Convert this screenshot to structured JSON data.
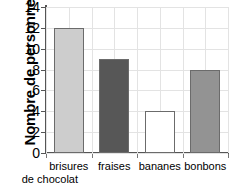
{
  "chart_data": {
    "type": "bar",
    "title": "",
    "xlabel": "",
    "ylabel": "Nombre de personnes",
    "categories": [
      "brisures de chocolat",
      "fraises",
      "bananes",
      "bonbons"
    ],
    "category_lines": [
      [
        "brisures",
        "de chocolat"
      ],
      [
        "fraises"
      ],
      [
        "bananes"
      ],
      [
        "bonbons"
      ]
    ],
    "values": [
      12,
      9,
      4,
      8
    ],
    "ylim": [
      0,
      14
    ],
    "ytick_values": [
      0,
      2,
      4,
      6,
      8,
      10,
      12,
      14
    ],
    "ytick_labels": [
      "0",
      "2",
      "4",
      "6",
      "8",
      "10",
      "12",
      "14"
    ],
    "grid": true,
    "legend": "none",
    "bar_colors": [
      "#cdcdcd",
      "#575757",
      "#ffffff",
      "#939393"
    ],
    "bar_edge_color": "#6b6b6b",
    "grid_color": "#e3e3e3",
    "axis_color": "#555555"
  }
}
